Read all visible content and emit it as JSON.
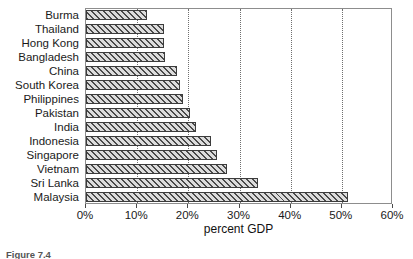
{
  "chart_data": {
    "type": "bar",
    "orientation": "horizontal",
    "title": "",
    "xlabel": "percent GDP",
    "ylabel": "",
    "xlim": [
      0,
      60
    ],
    "xticks": [
      "0%",
      "10%",
      "20%",
      "30%",
      "40%",
      "50%",
      "60%"
    ],
    "xtick_values": [
      0,
      10,
      20,
      30,
      40,
      50,
      60
    ],
    "grid": "vertical-dotted",
    "legend": "none",
    "categories": [
      "Burma",
      "Thailand",
      "Hong Kong",
      "Bangladesh",
      "China",
      "South Korea",
      "Philippines",
      "Pakistan",
      "India",
      "Indonesia",
      "Singapore",
      "Vietnam",
      "Sri Lanka",
      "Malaysia"
    ],
    "values": [
      12,
      15.2,
      15.3,
      15.4,
      17.8,
      18.4,
      19,
      20.4,
      21.5,
      24.5,
      25.6,
      27.6,
      33.6,
      51.2
    ]
  },
  "caption": {
    "label": "Figure 7.4",
    "text": ""
  }
}
